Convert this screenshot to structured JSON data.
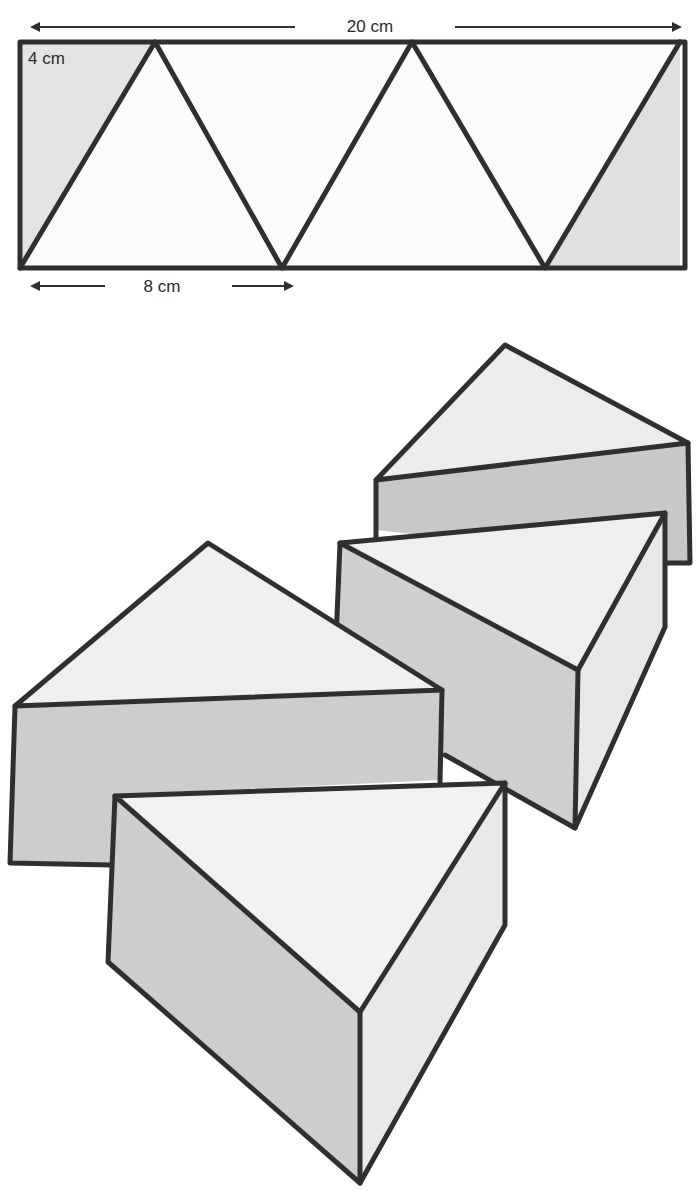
{
  "figure": {
    "type": "net diagram with cut triangular prisms",
    "net": {
      "width_label": "20 cm",
      "height_label": "4 cm",
      "base_label": "8 cm",
      "triangle_count": 3,
      "shaded_corner_pieces": 2
    },
    "pieces": {
      "count": 4,
      "description": "Triangular prism pieces cut from the strip"
    },
    "colors": {
      "line": "#2f2f2f",
      "shade_light": "#ededed",
      "shade_mid": "#d2d2d2",
      "shade_dark": "#c4c4c4",
      "background": "#ffffff"
    }
  }
}
